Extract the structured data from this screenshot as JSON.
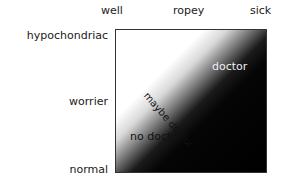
{
  "axes": {
    "x_labels": [
      "well",
      "ropey",
      "sick"
    ],
    "y_labels": [
      "hypochondriac",
      "worrier",
      "normal"
    ]
  },
  "regions": {
    "high": "doctor",
    "middle": "maybe doctor",
    "low": "no doctor"
  },
  "colors": {
    "low": "#ffffff",
    "high": "#000000",
    "border": "#333333"
  }
}
